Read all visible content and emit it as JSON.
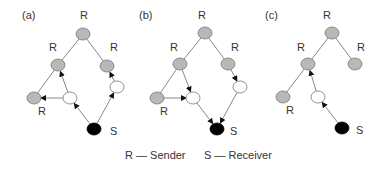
{
  "colors": {
    "sender_fill": "#b8b8b8",
    "receiver_fill": "#000000",
    "relay_fill": "#ffffff",
    "stroke": "#777777",
    "edge": "#888888",
    "arrow": "#111111",
    "text": "#333333"
  },
  "legend": {
    "sender": "R — Sender",
    "receiver": "S — Receiver"
  },
  "panels": [
    {
      "id": "a",
      "label": "(a)",
      "label_pos": [
        22,
        19
      ],
      "nodes": [
        {
          "id": "top",
          "type": "sender",
          "x": 83,
          "y": 34,
          "label": "R",
          "lx": 80,
          "ly": 19
        },
        {
          "id": "lm",
          "type": "sender",
          "x": 58,
          "y": 65,
          "label": "R",
          "lx": 49,
          "ly": 51
        },
        {
          "id": "rm",
          "type": "sender",
          "x": 107,
          "y": 66,
          "label": "R",
          "lx": 110,
          "ly": 51
        },
        {
          "id": "bl",
          "type": "sender",
          "x": 34,
          "y": 98,
          "label": "R",
          "lx": 38,
          "ly": 115
        },
        {
          "id": "w1",
          "type": "relay",
          "x": 70,
          "y": 98
        },
        {
          "id": "w2",
          "type": "relay",
          "x": 117,
          "y": 87
        },
        {
          "id": "s",
          "type": "receiver",
          "x": 94,
          "y": 129,
          "label": "S",
          "lx": 110,
          "ly": 135
        }
      ],
      "edges": [
        {
          "from": "top",
          "to": "lm",
          "arrow": false
        },
        {
          "from": "top",
          "to": "rm",
          "arrow": false
        },
        {
          "from": "lm",
          "to": "bl",
          "arrow": false
        },
        {
          "from": "w1",
          "to": "lm",
          "arrow": true
        },
        {
          "from": "w1",
          "to": "bl",
          "arrow": true
        },
        {
          "from": "s",
          "to": "w1",
          "arrow": true
        },
        {
          "from": "s",
          "to": "w2",
          "arrow": true
        },
        {
          "from": "w2",
          "to": "rm",
          "arrow": true
        }
      ]
    },
    {
      "id": "b",
      "label": "(b)",
      "label_pos": [
        139,
        19
      ],
      "nodes": [
        {
          "id": "top",
          "type": "sender",
          "x": 205,
          "y": 33,
          "label": "R",
          "lx": 198,
          "ly": 19
        },
        {
          "id": "lm",
          "type": "sender",
          "x": 180,
          "y": 64,
          "label": "R",
          "lx": 170,
          "ly": 51
        },
        {
          "id": "rm",
          "type": "sender",
          "x": 228,
          "y": 64,
          "label": "R",
          "lx": 231,
          "ly": 51
        },
        {
          "id": "bl",
          "type": "sender",
          "x": 157,
          "y": 98,
          "label": "R",
          "lx": 160,
          "ly": 115
        },
        {
          "id": "w1",
          "type": "relay",
          "x": 193,
          "y": 98
        },
        {
          "id": "w2",
          "type": "relay",
          "x": 240,
          "y": 87
        },
        {
          "id": "s",
          "type": "receiver",
          "x": 217,
          "y": 129,
          "label": "S",
          "lx": 230,
          "ly": 135
        }
      ],
      "edges": [
        {
          "from": "top",
          "to": "lm",
          "arrow": false
        },
        {
          "from": "top",
          "to": "rm",
          "arrow": false
        },
        {
          "from": "lm",
          "to": "bl",
          "arrow": false
        },
        {
          "from": "lm",
          "to": "w1",
          "arrow": true
        },
        {
          "from": "bl",
          "to": "w1",
          "arrow": true
        },
        {
          "from": "w1",
          "to": "s",
          "arrow": true
        },
        {
          "from": "rm",
          "to": "w2",
          "arrow": true
        },
        {
          "from": "w2",
          "to": "s",
          "arrow": true
        }
      ]
    },
    {
      "id": "c",
      "label": "(c)",
      "label_pos": [
        265,
        19
      ],
      "nodes": [
        {
          "id": "top",
          "type": "sender",
          "x": 332,
          "y": 33,
          "label": "R",
          "lx": 323,
          "ly": 19
        },
        {
          "id": "lm",
          "type": "sender",
          "x": 308,
          "y": 64,
          "label": "R",
          "lx": 297,
          "ly": 51
        },
        {
          "id": "rm",
          "type": "sender",
          "x": 355,
          "y": 64,
          "label": "R",
          "lx": 357,
          "ly": 51
        },
        {
          "id": "bl",
          "type": "sender",
          "x": 283,
          "y": 97,
          "label": "R",
          "lx": 286,
          "ly": 114
        },
        {
          "id": "w1",
          "type": "relay",
          "x": 318,
          "y": 97
        },
        {
          "id": "s",
          "type": "receiver",
          "x": 342,
          "y": 128,
          "label": "S",
          "lx": 356,
          "ly": 134
        }
      ],
      "edges": [
        {
          "from": "top",
          "to": "lm",
          "arrow": false
        },
        {
          "from": "top",
          "to": "rm",
          "arrow": false
        },
        {
          "from": "lm",
          "to": "bl",
          "arrow": false
        },
        {
          "from": "w1",
          "to": "lm",
          "arrow": true
        },
        {
          "from": "s",
          "to": "w1",
          "arrow": true
        }
      ]
    }
  ]
}
